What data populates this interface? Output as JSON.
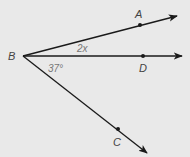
{
  "diagram": {
    "type": "angle-rays",
    "vertex": {
      "label": "B"
    },
    "rays": [
      {
        "id": "BA",
        "point_label": "A"
      },
      {
        "id": "BD",
        "point_label": "D"
      },
      {
        "id": "BC",
        "point_label": "C"
      }
    ],
    "angles": [
      {
        "between": [
          "BA",
          "BD"
        ],
        "label": "2x"
      },
      {
        "between": [
          "BD",
          "BC"
        ],
        "label": "37°"
      }
    ],
    "colors": {
      "background": "#e9e9e9",
      "line": "#1a1a1a",
      "label": "#444444",
      "angle_label": "#777777"
    }
  }
}
